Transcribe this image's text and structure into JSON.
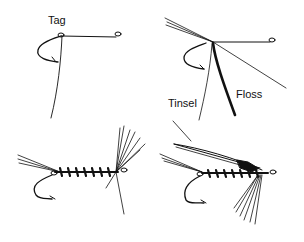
{
  "figure": {
    "panels": [
      {
        "id": "step-1",
        "label": "Tag"
      },
      {
        "id": "step-2",
        "labels": [
          "Tinsel",
          "Floss"
        ]
      },
      {
        "id": "step-3"
      },
      {
        "id": "step-4"
      }
    ]
  },
  "colors": {
    "ink": "#111111",
    "background": "#ffffff"
  }
}
